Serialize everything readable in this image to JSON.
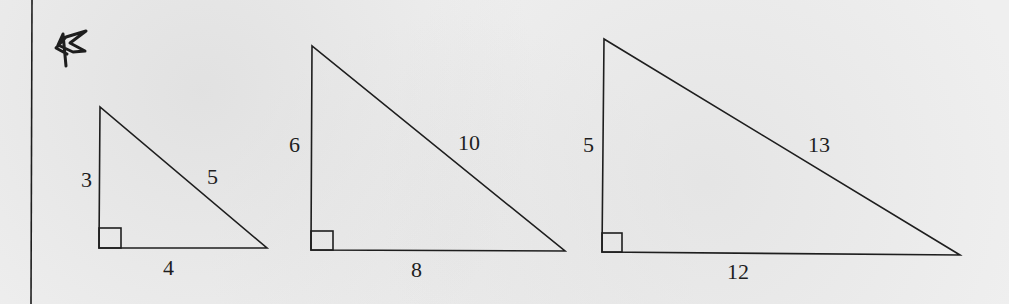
{
  "diagram": {
    "marker_icon": "hand-drawn-star-icon",
    "stroke_color": "#1e1e1e",
    "background_color": "#efefef",
    "triangles": [
      {
        "id": "triangle-1",
        "vertical_leg": "3",
        "horizontal_leg": "4",
        "hypotenuse": "5"
      },
      {
        "id": "triangle-2",
        "vertical_leg": "6",
        "horizontal_leg": "8",
        "hypotenuse": "10"
      },
      {
        "id": "triangle-3",
        "vertical_leg": "5",
        "horizontal_leg": "12",
        "hypotenuse": "13"
      }
    ]
  }
}
